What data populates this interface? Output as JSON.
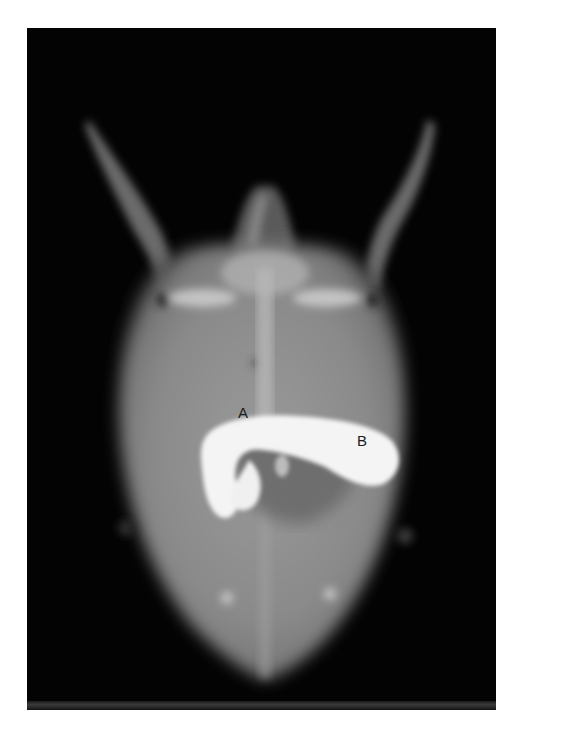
{
  "figure": {
    "type": "radiograph",
    "background_color": "#030303",
    "contrast_color": "#f4f4f4",
    "shell_color": "#8f8f8f",
    "labels": [
      {
        "id": "A",
        "text": "A"
      },
      {
        "id": "B",
        "text": "B"
      }
    ]
  },
  "caption": {
    "text": "",
    "visible": "cut off at bottom edge; only tops of glyphs visible"
  }
}
